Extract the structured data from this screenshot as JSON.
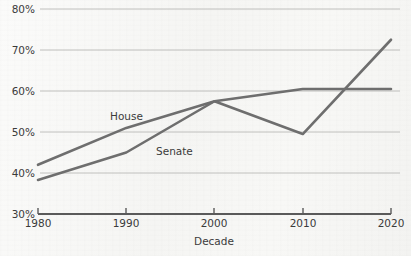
{
  "chart_data": {
    "type": "line",
    "title": "",
    "subtitle": "",
    "xlabel": "Decade",
    "ylabel": "",
    "x": [
      1980,
      1990,
      2000,
      2010,
      2020
    ],
    "xtick_labels": [
      "1980",
      "1990",
      "2000",
      "2010",
      "2020"
    ],
    "ytick_labels": [
      "30%",
      "40%",
      "50%",
      "60%",
      "70%",
      "80%"
    ],
    "yticks": [
      30,
      40,
      50,
      60,
      70,
      80
    ],
    "ylim": [
      30,
      80
    ],
    "xlim": [
      1980,
      2020
    ],
    "grid": "horizontal",
    "legend_position": "inline-annotations",
    "series": [
      {
        "name": "House",
        "label": "House",
        "color": "#6e6e6e",
        "values": [
          42.0,
          51.0,
          57.5,
          60.5,
          60.5
        ]
      },
      {
        "name": "Senate",
        "label": "Senate",
        "color": "#6e6e6e",
        "values": [
          38.3,
          45.0,
          57.5,
          49.5,
          72.5
        ]
      }
    ],
    "annotations": [
      {
        "text": "House",
        "x": 1990,
        "y": 54.5
      },
      {
        "text": "Senate",
        "x": 2001,
        "y": 47.0
      }
    ]
  },
  "style": {
    "background": "#f7f7f5",
    "line_color": "#6e6e6e",
    "grid_color": "#b9b9b7",
    "axis_color": "#5a5a5a",
    "text_color": "#3b3b3b"
  }
}
